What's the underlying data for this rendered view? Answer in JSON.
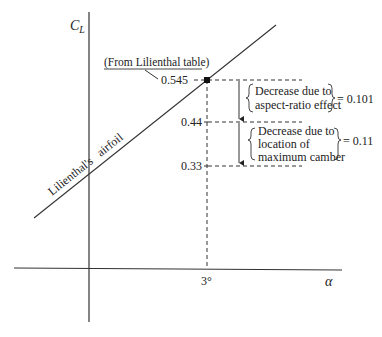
{
  "diagram": {
    "y_axis_label": "C",
    "y_axis_label_sub": "L",
    "x_axis_label": "α",
    "x_tick": "3°",
    "line_label": "Lilienthal's   airfoil",
    "source_note": "(From Lilienthal table)",
    "levels": {
      "top": "0.545",
      "mid": "0.44",
      "low": "0.33"
    },
    "annotations": [
      {
        "lines": [
          "Decrease due to",
          "aspect-ratio effect"
        ],
        "value": "= 0.101"
      },
      {
        "lines": [
          "Decrease due to",
          "location of",
          "maximum camber"
        ],
        "value": "= 0.11"
      }
    ]
  }
}
